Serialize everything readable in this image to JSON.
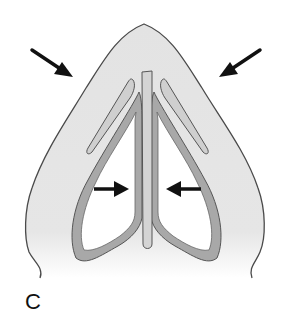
{
  "figure": {
    "panel_label": "C",
    "colors": {
      "skin_fill": "#e4e4e4",
      "skin_outline": "#4a4a4a",
      "cartilage_fill": "#a8a8a8",
      "cartilage_outline": "#555555",
      "septum_fill": "#d0d0d0",
      "nostril_fill": "#ffffff",
      "arrow": "#111111"
    },
    "arrows": [
      {
        "id": "outer-left",
        "direction": "down-right"
      },
      {
        "id": "outer-right",
        "direction": "down-left"
      },
      {
        "id": "inner-left",
        "direction": "right"
      },
      {
        "id": "inner-right",
        "direction": "left"
      }
    ]
  }
}
